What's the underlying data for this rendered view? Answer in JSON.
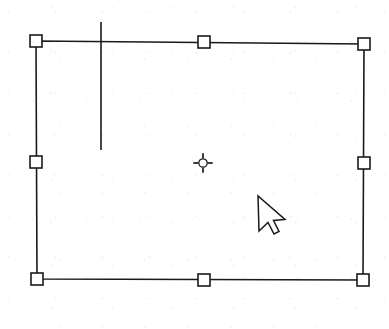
{
  "scene": {
    "kind": "vector-drawing-selection",
    "description": "Selected rectangular object with eight square resize handles, a rotation-center marker, a vertical guide line and a mouse arrow cursor",
    "background_color": "#ffffff",
    "stroke_color": "#1a1a1a",
    "handle_fill_color": "#ffffff",
    "canvas": {
      "width": 389,
      "height": 329
    }
  },
  "selection": {
    "label": "selection-bounding-box",
    "stroke_width": 1.6,
    "corners": {
      "top_left": {
        "x": 36,
        "y": 41
      },
      "top_right": {
        "x": 364,
        "y": 44
      },
      "bottom_right": {
        "x": 363,
        "y": 280
      },
      "bottom_left": {
        "x": 37,
        "y": 279
      }
    },
    "handles": [
      {
        "name": "handle-top-left",
        "x": 36,
        "y": 41,
        "size": 12,
        "cursor": "nwse-resize"
      },
      {
        "name": "handle-top-center",
        "x": 204,
        "y": 42,
        "size": 12,
        "cursor": "ns-resize"
      },
      {
        "name": "handle-top-right",
        "x": 364,
        "y": 44,
        "size": 12,
        "cursor": "nesw-resize"
      },
      {
        "name": "handle-middle-left",
        "x": 36,
        "y": 162,
        "size": 12,
        "cursor": "ew-resize"
      },
      {
        "name": "handle-middle-right",
        "x": 364,
        "y": 163,
        "size": 12,
        "cursor": "ew-resize"
      },
      {
        "name": "handle-bottom-left",
        "x": 37,
        "y": 279,
        "size": 12,
        "cursor": "nesw-resize"
      },
      {
        "name": "handle-bottom-center",
        "x": 204,
        "y": 280,
        "size": 12,
        "cursor": "ns-resize"
      },
      {
        "name": "handle-bottom-right",
        "x": 363,
        "y": 280,
        "size": 12,
        "cursor": "nwse-resize"
      }
    ]
  },
  "rotation_center": {
    "name": "rotation-center-marker",
    "x": 203,
    "y": 163,
    "radius": 4.2,
    "tick_length": 5.5
  },
  "guide_line": {
    "name": "vertical-guide-line",
    "x": 101,
    "y_top": 22,
    "y_bottom": 150,
    "stroke_width": 1.6
  },
  "cursor": {
    "name": "mouse-arrow-cursor",
    "tip_x": 258,
    "tip_y": 196,
    "style": "arrow-with-tail"
  }
}
